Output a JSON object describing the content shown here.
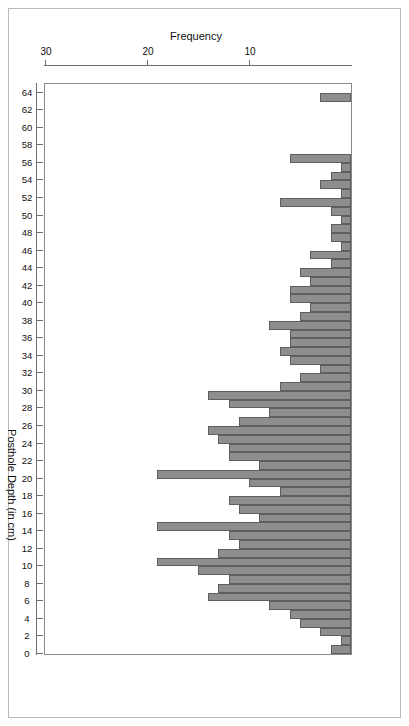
{
  "chart_data": {
    "type": "bar",
    "orientation": "horizontal-rotated-180",
    "title": "",
    "xlabel": "Frequency",
    "ylabel": "Posthole Depth (in cm)",
    "xlim": [
      0,
      30
    ],
    "ylim": [
      0,
      65
    ],
    "grid": false,
    "legend": null,
    "bar_color": "#8e8e8e",
    "bar_border_color": "#5e5e5e",
    "x_tick_labels": [
      "30",
      "20",
      "10"
    ],
    "x_tick_values": [
      30,
      20,
      10
    ],
    "y_tick_labels": [
      "0",
      "2",
      "4",
      "6",
      "8",
      "10",
      "12",
      "14",
      "16",
      "18",
      "20",
      "22",
      "24",
      "26",
      "28",
      "30",
      "32",
      "34",
      "36",
      "38",
      "40",
      "42",
      "44",
      "46",
      "48",
      "50",
      "52",
      "54",
      "56",
      "58",
      "60",
      "62",
      "64"
    ],
    "y_tick_values": [
      0,
      2,
      4,
      6,
      8,
      10,
      12,
      14,
      16,
      18,
      20,
      22,
      24,
      26,
      28,
      30,
      32,
      34,
      36,
      38,
      40,
      42,
      44,
      46,
      48,
      50,
      52,
      54,
      56,
      58,
      60,
      62,
      64
    ],
    "categories": [
      1,
      2,
      3,
      4,
      5,
      6,
      7,
      8,
      9,
      10,
      11,
      12,
      13,
      14,
      15,
      16,
      17,
      18,
      19,
      20,
      21,
      22,
      23,
      24,
      25,
      26,
      27,
      28,
      29,
      30,
      31,
      32,
      33,
      34,
      35,
      36,
      37,
      38,
      39,
      40,
      41,
      42,
      43,
      44,
      45,
      46,
      47,
      48,
      49,
      50,
      51,
      52,
      53,
      54,
      55,
      56,
      57,
      58,
      59,
      60,
      61,
      62,
      63,
      64
    ],
    "values": [
      2,
      1,
      3,
      5,
      6,
      8,
      14,
      13,
      12,
      15,
      19,
      13,
      11,
      12,
      19,
      9,
      11,
      12,
      7,
      10,
      19,
      9,
      12,
      12,
      13,
      14,
      11,
      8,
      12,
      14,
      7,
      5,
      3,
      6,
      7,
      6,
      6,
      8,
      5,
      4,
      6,
      6,
      4,
      5,
      2,
      4,
      1,
      2,
      2,
      1,
      2,
      7,
      1,
      3,
      2,
      1,
      6,
      0,
      0,
      0,
      0,
      0,
      0,
      3
    ]
  },
  "axes": {
    "frequency_title": "Frequency",
    "depth_title": "Posthole Depth (in cm)"
  }
}
